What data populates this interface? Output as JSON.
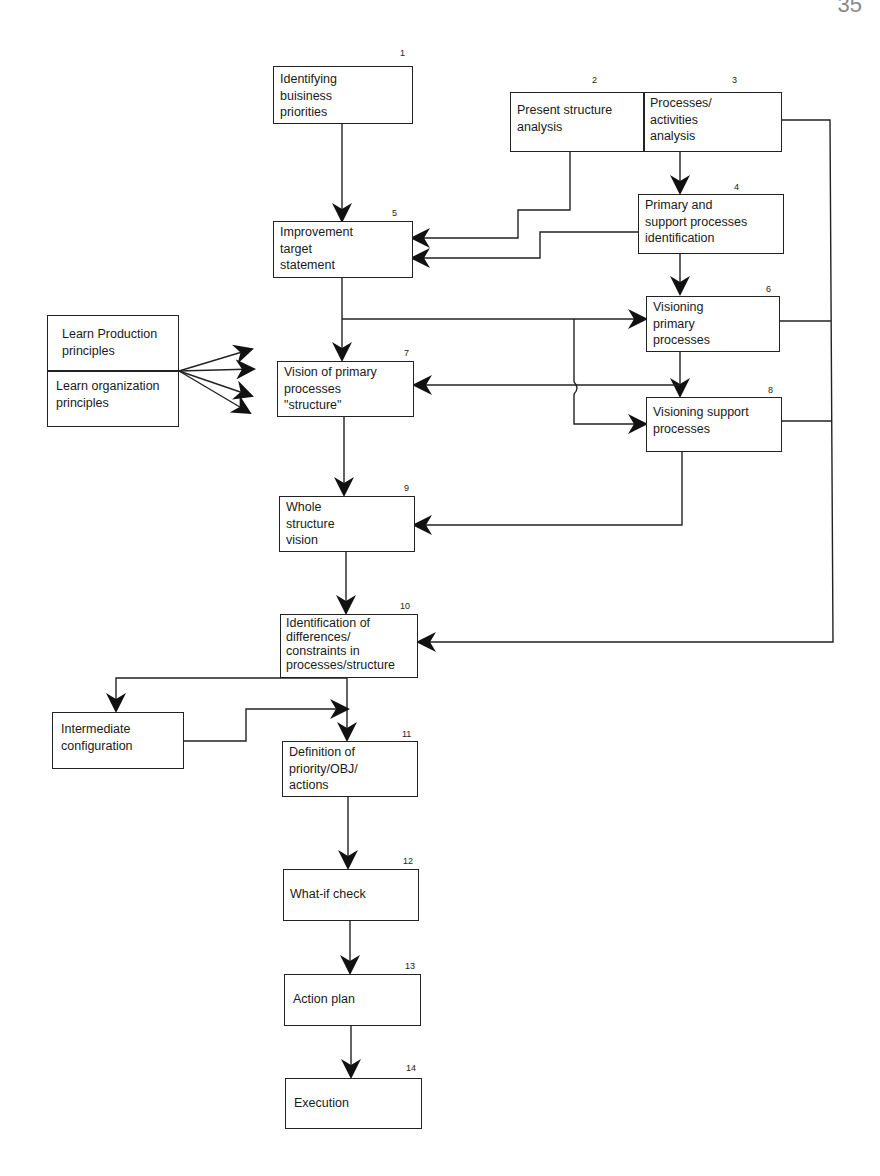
{
  "page_number": "35",
  "nodes": [
    {
      "id": "1",
      "number": "1",
      "label": "Identifying buisiness priorities",
      "lines": [
        "Identifying",
        "buisiness",
        "priorities"
      ]
    },
    {
      "id": "2",
      "number": "2",
      "label": "Present structure analysis",
      "lines": [
        "Present structure",
        "analysis"
      ]
    },
    {
      "id": "3",
      "number": "3",
      "label": "Processes/ activities analysis",
      "lines": [
        "Processes/",
        "activities",
        "analysis"
      ]
    },
    {
      "id": "4",
      "number": "4",
      "label": "Primary and support processes identification",
      "lines": [
        "Primary and",
        "support processes",
        "identification"
      ]
    },
    {
      "id": "5",
      "number": "5",
      "label": "Improvement target statement",
      "lines": [
        "Improvement",
        "target",
        "statement"
      ]
    },
    {
      "id": "6",
      "number": "6",
      "label": "Visioning primary processes",
      "lines": [
        "Visioning",
        "primary",
        "processes"
      ]
    },
    {
      "id": "7",
      "number": "7",
      "label": "Vision of primary processes \"structure\"",
      "lines": [
        "Vision of primary",
        "processes",
        "\"structure\""
      ]
    },
    {
      "id": "8",
      "number": "8",
      "label": "Visioning support processes",
      "lines": [
        "Visioning support",
        "processes"
      ]
    },
    {
      "id": "9",
      "number": "9",
      "label": "Whole structure vision",
      "lines": [
        "Whole",
        "structure",
        "vision"
      ]
    },
    {
      "id": "10",
      "number": "10",
      "label": "Identification of differences/ constraints in processes/structure",
      "lines": [
        "Identification of",
        "differences/",
        "constraints in",
        "processes/structure"
      ]
    },
    {
      "id": "11",
      "number": "11",
      "label": "Definition of priority/OBJ/ actions",
      "lines": [
        "Definition of",
        "priority/OBJ/",
        "actions"
      ]
    },
    {
      "id": "12",
      "number": "12",
      "label": "What-if check",
      "lines": [
        "What-if check"
      ]
    },
    {
      "id": "13",
      "number": "13",
      "label": "Action plan",
      "lines": [
        "Action plan"
      ]
    },
    {
      "id": "14",
      "number": "14",
      "label": "Execution",
      "lines": [
        "Execution"
      ]
    },
    {
      "id": "lp",
      "number": "",
      "label": "Learn Production principles",
      "lines": [
        "Learn Production",
        "principles"
      ]
    },
    {
      "id": "lo",
      "number": "",
      "label": "Learn organization principles",
      "lines": [
        "Learn organization",
        "principles"
      ]
    },
    {
      "id": "ic",
      "number": "",
      "label": "Intermediate configuration",
      "lines": [
        "Intermediate",
        "configuration"
      ]
    }
  ],
  "edges": [
    [
      "1",
      "5"
    ],
    [
      "2",
      "5"
    ],
    [
      "3",
      "4"
    ],
    [
      "4",
      "5"
    ],
    [
      "4",
      "6"
    ],
    [
      "5",
      "6"
    ],
    [
      "5",
      "7"
    ],
    [
      "5",
      "8"
    ],
    [
      "6",
      "8"
    ],
    [
      "8",
      "7"
    ],
    [
      "lp",
      "7"
    ],
    [
      "lo",
      "7"
    ],
    [
      "7",
      "9"
    ],
    [
      "8",
      "9"
    ],
    [
      "9",
      "10"
    ],
    [
      "3",
      "10"
    ],
    [
      "6",
      "10"
    ],
    [
      "8",
      "10"
    ],
    [
      "10",
      "ic"
    ],
    [
      "10",
      "11"
    ],
    [
      "ic",
      "11"
    ],
    [
      "11",
      "12"
    ],
    [
      "12",
      "13"
    ],
    [
      "13",
      "14"
    ]
  ]
}
